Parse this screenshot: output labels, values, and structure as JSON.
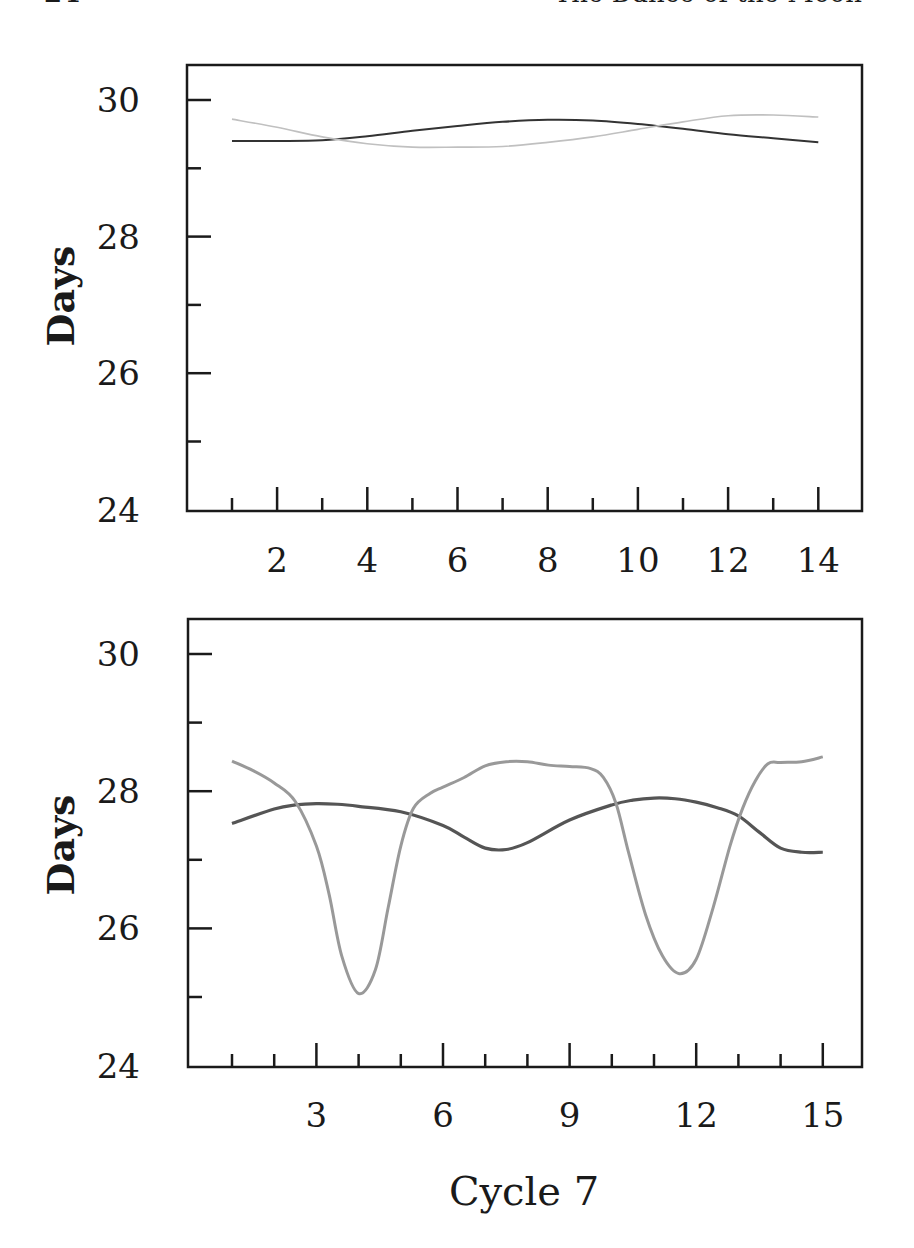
{
  "running_head": {
    "page_number": "24",
    "book_title": "The Dance of the Moon"
  },
  "x_axis_caption": "Cycle 7",
  "colors": {
    "frame": "#1a1a1a",
    "top_dark": "#333333",
    "top_light": "#c0c0c0",
    "bottom_dark": "#555555",
    "bottom_light": "#999999"
  },
  "chart_data": [
    {
      "type": "line",
      "title": "",
      "xlabel": "",
      "ylabel": "Days",
      "xlim": [
        0.5,
        15
      ],
      "ylim": [
        24,
        30.5
      ],
      "x_ticks_major": [
        2,
        4,
        6,
        8,
        10,
        12,
        14
      ],
      "x_ticks_minor": [
        1,
        3,
        5,
        7,
        9,
        11,
        13
      ],
      "y_ticks_major": [
        24,
        26,
        28,
        30
      ],
      "y_ticks_minor": [
        25,
        27,
        29
      ],
      "grid": false,
      "legend": null,
      "series": [
        {
          "name": "dark",
          "style": "dark",
          "x": [
            1,
            2,
            3,
            4,
            5,
            6,
            7,
            8,
            9,
            10,
            11,
            12,
            13,
            14
          ],
          "values": [
            29.4,
            29.4,
            29.41,
            29.47,
            29.55,
            29.62,
            29.68,
            29.71,
            29.7,
            29.65,
            29.58,
            29.5,
            29.44,
            29.38
          ]
        },
        {
          "name": "light",
          "style": "light",
          "x": [
            1,
            2,
            3,
            4,
            5,
            6,
            7,
            8,
            9,
            10,
            11,
            12,
            13,
            14
          ],
          "values": [
            29.72,
            29.6,
            29.46,
            29.36,
            29.31,
            29.31,
            29.32,
            29.38,
            29.46,
            29.57,
            29.68,
            29.77,
            29.78,
            29.75
          ]
        }
      ]
    },
    {
      "type": "line",
      "title": "",
      "xlabel": "Cycle 7",
      "ylabel": "Days",
      "xlim": [
        0,
        16
      ],
      "ylim": [
        24,
        30.5
      ],
      "x_ticks_major": [
        3,
        6,
        9,
        12,
        15
      ],
      "x_ticks_minor": [
        1,
        2,
        4,
        5,
        7,
        8,
        10,
        11,
        13,
        14
      ],
      "y_ticks_major": [
        24,
        26,
        28,
        30
      ],
      "y_ticks_minor": [
        25,
        27,
        29
      ],
      "grid": false,
      "legend": null,
      "series": [
        {
          "name": "dark",
          "style": "dark",
          "x": [
            1,
            2,
            2.5,
            3,
            3.5,
            4,
            5,
            6,
            6.5,
            7,
            7.5,
            8,
            9,
            10,
            10.5,
            11,
            11.5,
            12,
            12.5,
            13,
            13.5,
            14,
            14.5,
            15
          ],
          "values": [
            27.53,
            27.74,
            27.8,
            27.82,
            27.81,
            27.78,
            27.7,
            27.5,
            27.33,
            27.17,
            27.15,
            27.25,
            27.58,
            27.8,
            27.87,
            27.9,
            27.89,
            27.84,
            27.76,
            27.64,
            27.4,
            27.17,
            27.11,
            27.11
          ]
        },
        {
          "name": "light",
          "style": "light",
          "x": [
            1,
            1.5,
            2,
            2.5,
            3,
            3.3,
            3.6,
            4,
            4.4,
            4.7,
            5,
            5.3,
            5.7,
            6,
            6.5,
            7,
            7.5,
            8,
            8.5,
            9,
            9.5,
            9.8,
            10.1,
            10.4,
            10.8,
            11.2,
            11.6,
            12,
            12.4,
            12.8,
            13.1,
            13.4,
            13.7,
            14,
            14.5,
            15
          ],
          "values": [
            28.44,
            28.3,
            28.12,
            27.85,
            27.2,
            26.5,
            25.6,
            25.05,
            25.4,
            26.3,
            27.2,
            27.75,
            27.97,
            28.06,
            28.2,
            28.37,
            28.43,
            28.43,
            28.38,
            28.36,
            28.33,
            28.2,
            27.82,
            27.1,
            26.2,
            25.6,
            25.34,
            25.55,
            26.3,
            27.2,
            27.75,
            28.15,
            28.4,
            28.42,
            28.43,
            28.5
          ]
        }
      ]
    }
  ],
  "tick_labels": {
    "top": {
      "y": [
        "30",
        "28",
        "26",
        "24"
      ],
      "x": [
        "2",
        "4",
        "6",
        "8",
        "10",
        "12",
        "14"
      ]
    },
    "bottom": {
      "y": [
        "30",
        "28",
        "26",
        "24"
      ],
      "x": [
        "3",
        "6",
        "9",
        "12",
        "15"
      ]
    }
  }
}
